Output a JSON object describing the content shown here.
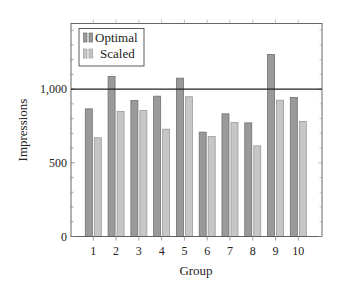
{
  "chart_data": {
    "type": "bar",
    "title": "",
    "xlabel": "Group",
    "ylabel": "Impressions",
    "categories": [
      "1",
      "2",
      "3",
      "4",
      "5",
      "6",
      "7",
      "8",
      "9",
      "10"
    ],
    "series": [
      {
        "name": "Optimal",
        "color": "#9a9a9a",
        "stroke": "#707070",
        "values": [
          866,
          1085,
          923,
          952,
          1074,
          708,
          832,
          771,
          1235,
          943
        ]
      },
      {
        "name": "Scaled",
        "color": "#c6c6c6",
        "stroke": "#9a9a9a",
        "values": [
          670,
          848,
          855,
          728,
          948,
          678,
          773,
          615,
          925,
          780
        ]
      }
    ],
    "ylim": [
      0,
      1440
    ],
    "yticks": [
      0,
      500,
      1000
    ],
    "ytick_labels": [
      "0",
      "500",
      "1,000"
    ],
    "reference_line": {
      "y": 1000,
      "color": "#222222"
    },
    "grid": false,
    "legend": {
      "position": "upper left",
      "entries": [
        "Optimal",
        "Scaled"
      ]
    }
  }
}
